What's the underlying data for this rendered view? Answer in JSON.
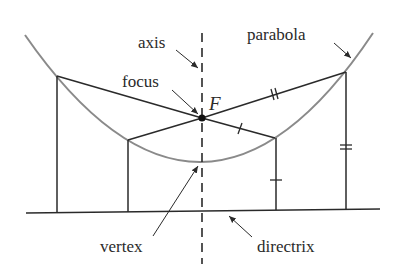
{
  "labels": {
    "axis": "axis",
    "focus": "focus",
    "focus_symbol": "F",
    "parabola": "parabola",
    "vertex": "vertex",
    "directrix": "directrix"
  },
  "colors": {
    "parabola": "#8a8a8a",
    "lines": "#2a2a2a",
    "text": "#2a2a2a",
    "background": "#ffffff"
  },
  "geometry": {
    "focus": [
      202,
      118
    ],
    "vertex": [
      202,
      162
    ],
    "directrix_y": 211,
    "points_on_parabola": [
      [
        57,
        76
      ],
      [
        128,
        140
      ],
      [
        275,
        138
      ],
      [
        346,
        72
      ]
    ]
  }
}
